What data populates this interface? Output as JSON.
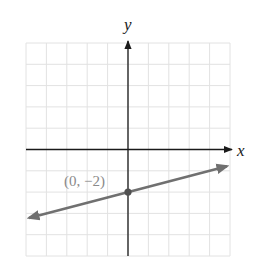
{
  "chart_data": {
    "type": "line",
    "title": "",
    "xlabel": "x",
    "ylabel": "y",
    "xlim": [
      -5,
      5
    ],
    "ylim": [
      -5,
      5
    ],
    "grid": true,
    "grid_step": 1,
    "tick_labels_shown": false,
    "series": [
      {
        "name": "y = (1/4)x - 2",
        "slope": 0.25,
        "intercept": -2,
        "x": [
          -4.85,
          4.85
        ],
        "y": [
          -3.2125,
          -0.7875
        ],
        "arrows_both_ends": true,
        "color": "#707070"
      }
    ],
    "annotations": [
      {
        "text": "(0, −2)",
        "x": 0,
        "y": -2,
        "marker": true
      }
    ]
  },
  "colors": {
    "grid": "#e2e2e2",
    "axis": "#1a1a1a",
    "line": "#707070",
    "point": "#505050",
    "label": "#8a8a8a"
  },
  "labels": {
    "x_axis": "x",
    "y_axis": "y",
    "point": "(0, −2)"
  }
}
